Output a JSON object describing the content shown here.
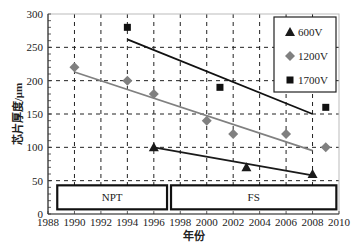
{
  "chart_data": {
    "type": "scatter",
    "title": "",
    "xlabel": "年份",
    "ylabel": "芯片厚度/μm",
    "xlim": [
      1988,
      2010
    ],
    "ylim": [
      0,
      300
    ],
    "x_ticks": [
      1988,
      1990,
      1992,
      1994,
      1996,
      1998,
      2000,
      2002,
      2004,
      2006,
      2008,
      2010
    ],
    "y_ticks": [
      0,
      50,
      100,
      150,
      200,
      250,
      300
    ],
    "grid": true,
    "legend_position": "upper right",
    "series": [
      {
        "name": "600V",
        "marker": "triangle",
        "color": "#1a1a1a",
        "points": [
          [
            1996,
            100
          ],
          [
            2003,
            70
          ],
          [
            2008,
            60
          ]
        ],
        "trend_line": [
          [
            1996,
            100
          ],
          [
            2008,
            58
          ]
        ]
      },
      {
        "name": "1200V",
        "marker": "diamond",
        "color": "#808080",
        "points": [
          [
            1990,
            220
          ],
          [
            1994,
            200
          ],
          [
            1996,
            180
          ],
          [
            2000,
            140
          ],
          [
            2002,
            120
          ],
          [
            2006,
            120
          ],
          [
            2009,
            100
          ]
        ],
        "trend_line": [
          [
            1990,
            213
          ],
          [
            2008,
            95
          ]
        ]
      },
      {
        "name": "1700V",
        "marker": "square",
        "color": "#111111",
        "points": [
          [
            1994,
            280
          ],
          [
            2001,
            190
          ],
          [
            2009,
            160
          ]
        ],
        "trend_line": [
          [
            1994,
            262
          ],
          [
            2008,
            150
          ]
        ]
      }
    ],
    "annotations": [
      {
        "label": "NPT",
        "x_from": 1988.7,
        "x_to": 1997.0,
        "y_from": 7,
        "y_to": 43
      },
      {
        "label": "FS",
        "x_from": 1997.3,
        "x_to": 2009.8,
        "y_from": 7,
        "y_to": 43
      }
    ]
  }
}
